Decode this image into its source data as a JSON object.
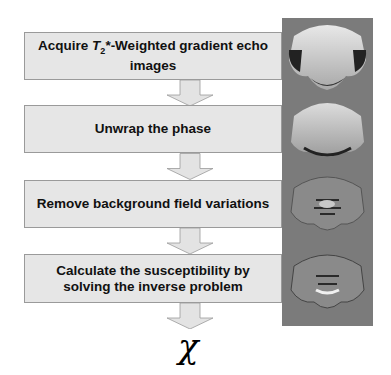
{
  "diagram": {
    "steps": [
      {
        "pre": "Acquire ",
        "t": "T",
        "sub": "2",
        "post": "*-Weighted gradient echo images"
      },
      {
        "label": "Unwrap the phase"
      },
      {
        "label": "Remove background field variations"
      },
      {
        "label": "Calculate the susceptibility by solving the inverse problem"
      }
    ],
    "result_symbol": "χ",
    "images": [
      "wrapped-phase-image",
      "unwrapped-phase-image",
      "local-field-image",
      "susceptibility-map-image"
    ],
    "colors": {
      "box_fill": "#e6e6e6",
      "box_border": "#9a9a9a",
      "arrow_fill": "#e3e3e3",
      "panel_bg": "#7b7b7b"
    }
  }
}
